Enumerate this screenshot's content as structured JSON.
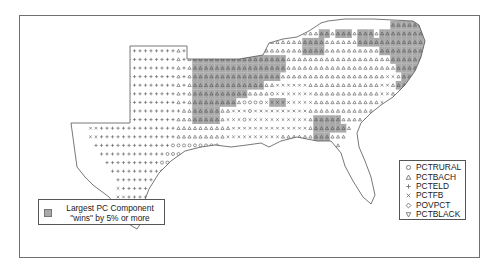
{
  "legend_symbols": {
    "items": [
      {
        "code": "o",
        "label": "PCTRURAL",
        "shape": "circle"
      },
      {
        "code": "a",
        "label": "PCTBACH",
        "shape": "triangle-up"
      },
      {
        "code": "+",
        "label": "PCTELD",
        "shape": "plus"
      },
      {
        "code": "x",
        "label": "PCTFB",
        "shape": "cross"
      },
      {
        "code": "d",
        "label": "POVPCT",
        "shape": "diamond"
      },
      {
        "code": "v",
        "label": "PCTBLACK",
        "shape": "triangle-down"
      }
    ]
  },
  "legend_wins": {
    "line1": "Largest PC Component",
    "line2": "\"wins\" by 5% or more",
    "swatch_color": "#a9a9a9"
  },
  "colors": {
    "shade": "#a9a9a9",
    "symbol": "#555555",
    "outline": "#555555"
  },
  "grid": {
    "x0": 75,
    "y0": 24,
    "step": 8.25,
    "rows": [
      "..........................................................AAAAAAAAAA.",
      ".........................................ooaaAAaAAAaAAAaAAAAAAAAAA..",
      ".............................aaaaaaaaaaaaaAAAAaaaaaaAAAAAAAAAAAAAA..",
      "..........+++++++++a+aAAAAAaaaaaaaaaaaaaaaAAAAaaaaaaaaaaAAAAAAAAA...",
      "..........+++++++++a+aAAAAAAAAAAAAAAAAAaaaaaaaaaaaaaaaaaaaAAAAAAA...",
      "..........+++++++++a+aAAAAAAAAAAAAAAAAAaaaaaaaaaaaaaaaaaaaaAAAAAA...",
      "..........+++++++++a+aAAAAAAAAAAAAAAAAaaaaaaaaaaaaaaaaaaaxxaAAAA....",
      "..........+++++++++a+aAAAAAAAAAAAAAaaxxxxxxaaaaaaaaaaaaaxxaAAAA.....",
      "..........+++++++++a+aAAAAAAAAAAaaaaoxxxxxxxaaaaaaaaaaaaxxaaa.......",
      "..........+++++++++a+aAAAAAAAAaooooxXXXxxxxxaaaaaaaaaaaaxx..........",
      "++++++++++++++++++++aaAAAAAaaxxxoxxxxxxxxxxaaaaaaaaaaaa.............",
      ".++++++++++++++++++aaaAAAAAaxxxoxxxxxxxxxxxaAAAAAaaaaa..............",
      "...xx++++++++++++++aaaaaaaaaaxxxxxxxxxxxxxxaAAAAAAa.................",
      "...xx++++++++++++++aaaaaaaaaxxxxxxxxxxaaaaaaAAAaaa..................",
      "....++++++++++++++ooooooooo..........ooooooooaaaa...................",
      ".....++++++++++++ooooo..................ooooooooo...................",
      "......++++++++++oooo.....................oooooooo...................",
      ".......+++++++++ooo........................ooooooo..................",
      "........++++++++oo..........................oooooo..................",
      "........x+++++++o............................ooooo..................",
      "........xx+++++o..............................oooo..................",
      "........xxx+++o...............................ooo...................",
      "........xx+++.................................oo....................",
      ".........xx+....................................................... ",
      "..........x........................................................."
    ]
  }
}
